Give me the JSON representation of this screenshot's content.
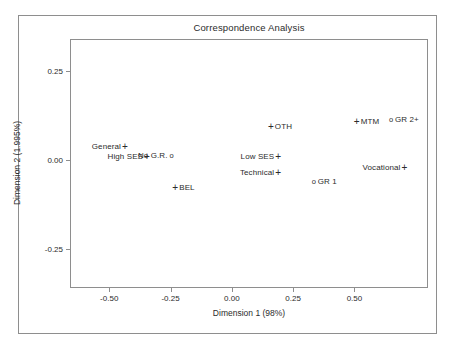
{
  "chart_data": {
    "type": "scatter",
    "title": "Correspondence Analysis",
    "xlabel": "Dimension 1 (98%)",
    "ylabel": "Dimension 2 (1.995%)",
    "xlim": [
      -0.66,
      0.8
    ],
    "ylim": [
      -0.36,
      0.34
    ],
    "xticks": [
      "-0.50",
      "-0.25",
      "0.00",
      "0.25",
      "0.50"
    ],
    "xtick_values": [
      -0.5,
      -0.25,
      0.0,
      0.25,
      0.5
    ],
    "yticks": [
      "0.25",
      "0.00",
      "-0.25"
    ],
    "ytick_values": [
      0.25,
      0.0,
      -0.25
    ],
    "grid": false,
    "legend": "none",
    "marker_types": {
      "plus": "+",
      "circle": "o"
    },
    "points": [
      {
        "label": "General",
        "x": -0.44,
        "y": 0.04,
        "marker": "plus",
        "label_pos": "left"
      },
      {
        "label": "High SES",
        "x": -0.35,
        "y": 0.01,
        "marker": "plus",
        "label_pos": "left"
      },
      {
        "label": "No G.R.",
        "x": -0.25,
        "y": 0.015,
        "marker": "circle",
        "label_pos": "left"
      },
      {
        "label": "BEL",
        "x": -0.235,
        "y": -0.075,
        "marker": "plus",
        "label_pos": "right"
      },
      {
        "label": "OTH",
        "x": 0.155,
        "y": 0.095,
        "marker": "plus",
        "label_pos": "right"
      },
      {
        "label": "Low SES",
        "x": 0.185,
        "y": 0.01,
        "marker": "plus",
        "label_pos": "left"
      },
      {
        "label": "Technical",
        "x": 0.185,
        "y": -0.035,
        "marker": "plus",
        "label_pos": "left"
      },
      {
        "label": "GR 1",
        "x": 0.33,
        "y": -0.06,
        "marker": "circle",
        "label_pos": "right"
      },
      {
        "label": "MTM",
        "x": 0.505,
        "y": 0.11,
        "marker": "plus",
        "label_pos": "right"
      },
      {
        "label": "GR 2+",
        "x": 0.645,
        "y": 0.115,
        "marker": "circle",
        "label_pos": "right"
      },
      {
        "label": "Vocational",
        "x": 0.7,
        "y": -0.02,
        "marker": "plus",
        "label_pos": "left"
      }
    ],
    "colors": {
      "background": "#ffffff",
      "frame": "#8e8e8e",
      "text": "#2b2b2b",
      "marker": "#2b2b2b"
    }
  }
}
